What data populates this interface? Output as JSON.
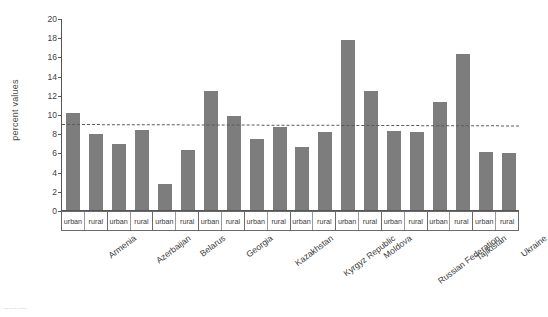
{
  "chart_data": {
    "type": "bar",
    "title": "",
    "subtitle": "",
    "xlabel": "",
    "ylabel": "percent values",
    "ylim": [
      0,
      20
    ],
    "yticks": [
      0,
      2,
      4,
      6,
      8,
      10,
      12,
      14,
      16,
      18,
      20
    ],
    "grid": false,
    "legend": "none",
    "bar_color": "#7d7d7d",
    "categories": [
      "Armenia",
      "Azerbaijan",
      "Belarus",
      "Georgia",
      "Kazakhstan",
      "Kyrgyz Republic",
      "Moldova",
      "Russian Federation",
      "Tajikistan",
      "Ukraine"
    ],
    "subcategories": [
      "urban",
      "rural"
    ],
    "series": [
      {
        "name": "urban",
        "values": [
          10.1,
          6.85,
          2.7,
          12.4,
          7.4,
          6.6,
          17.7,
          8.2,
          11.2,
          6.05
        ]
      },
      {
        "name": "rural",
        "values": [
          7.95,
          8.35,
          6.2,
          9.75,
          8.6,
          8.15,
          12.4,
          8.1,
          16.25,
          5.9
        ]
      }
    ],
    "values_flat": [
      10.1,
      7.95,
      6.85,
      8.35,
      2.7,
      6.2,
      12.4,
      9.75,
      7.4,
      8.6,
      6.6,
      8.15,
      17.7,
      12.4,
      8.2,
      8.1,
      11.2,
      16.25,
      6.05,
      5.9
    ],
    "reference_line": {
      "label": "",
      "style": "dashed",
      "color": "#5a5a5a",
      "value_left": 9.1,
      "value_right": 8.95
    },
    "annotations": []
  },
  "axis": {
    "y_title": "percent values",
    "y_ticks": [
      "0",
      "2",
      "4",
      "6",
      "8",
      "10",
      "12",
      "14",
      "16",
      "18",
      "20"
    ]
  },
  "xtable": {
    "groups": [
      {
        "country": "Armenia",
        "cells": [
          "urban",
          "rural"
        ]
      },
      {
        "country": "Azerbaijan",
        "cells": [
          "urban",
          "rural"
        ]
      },
      {
        "country": "Belarus",
        "cells": [
          "urban",
          "rural"
        ]
      },
      {
        "country": "Georgia",
        "cells": [
          "urban",
          "rural"
        ]
      },
      {
        "country": "Kazakhstan",
        "cells": [
          "urban",
          "rural"
        ]
      },
      {
        "country": "Kyrgyz Republic",
        "cells": [
          "urban",
          "rural"
        ]
      },
      {
        "country": "Moldova",
        "cells": [
          "urban",
          "rural"
        ]
      },
      {
        "country": "Russian Federation",
        "cells": [
          "urban",
          "rural"
        ]
      },
      {
        "country": "Tajikistan",
        "cells": [
          "urban",
          "rural"
        ]
      },
      {
        "country": "Ukraine",
        "cells": [
          "urban",
          "rural"
        ]
      }
    ]
  },
  "footer": {
    "cropped_text": "Source:"
  }
}
